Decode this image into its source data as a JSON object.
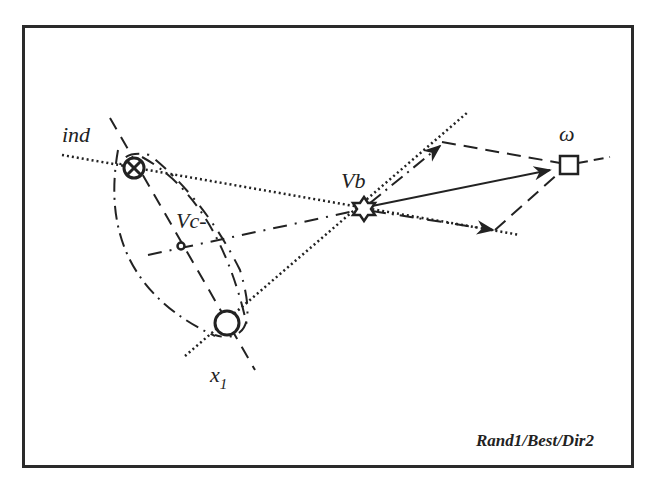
{
  "diagram": {
    "caption": "Rand1/Best/Dir2",
    "colors": {
      "stroke": "#222222",
      "background": "#ffffff",
      "frame": "#2a2a2a"
    },
    "nodes": {
      "ind": {
        "label": "ind",
        "symbol": "circle-times",
        "x": 134,
        "y": 168
      },
      "vc": {
        "label": "Vc-",
        "symbol": "small-circle",
        "x": 181,
        "y": 246
      },
      "x1": {
        "label": "x",
        "subscript": "1",
        "symbol": "circle",
        "x": 227,
        "y": 323
      },
      "vb": {
        "label": "Vb",
        "symbol": "six-point-star",
        "x": 364,
        "y": 209
      },
      "omega": {
        "label": "ω",
        "symbol": "square",
        "x": 569,
        "y": 165
      }
    },
    "edges": [
      {
        "from": "ind",
        "to": "vb",
        "style": "dotted",
        "extends": true
      },
      {
        "from": "x1",
        "to": "vb",
        "style": "dotted",
        "extends": true
      },
      {
        "from": "vc",
        "to": "vb",
        "style": "dash-dot",
        "extends": true
      },
      {
        "from": "ind",
        "to": "x1",
        "style": "dashed",
        "note": "dashed chord through Vc"
      },
      {
        "from": "vb",
        "to": "omega",
        "style": "solid-arrow"
      },
      {
        "from": "vb",
        "to": "upper-arrow",
        "style": "dash-dot-arrow"
      },
      {
        "from": "vb",
        "to": "lower-arrow",
        "style": "dash-dot-arrow"
      },
      {
        "from": "upper-arrow",
        "to": "omega",
        "style": "dashed"
      },
      {
        "from": "lower-arrow",
        "to": "omega",
        "style": "dashed"
      }
    ]
  }
}
